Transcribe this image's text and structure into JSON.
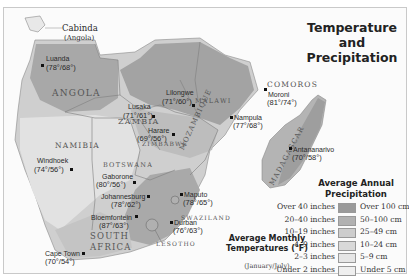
{
  "title": {
    "line1": "Temperature and",
    "line2": "Precipitation"
  },
  "countries": [
    {
      "name": "ANGOLA"
    },
    {
      "name": "ZAMBIA"
    },
    {
      "name": "MALAWI"
    },
    {
      "name": "ZIMBABWE"
    },
    {
      "name": "MOZAMBIQUE"
    },
    {
      "name": "NAMIBIA"
    },
    {
      "name": "BOTSWANA"
    },
    {
      "name": "SOUTH"
    },
    {
      "name": "AFRICA"
    },
    {
      "name": "SWAZILAND"
    },
    {
      "name": "LESOTHO"
    },
    {
      "name": "MADAGASCAR"
    },
    {
      "name": "COMOROS"
    }
  ],
  "region_labels": {
    "cabinda": "Cabinda",
    "cabinda_sub": "(Angola)"
  },
  "cities": [
    {
      "name": "Luanda",
      "temps": "(78°/68°)"
    },
    {
      "name": "Lilongwe",
      "temps": "(71°/60°)"
    },
    {
      "name": "Lusaka",
      "temps": "(71°/61°)"
    },
    {
      "name": "Harare",
      "temps": "(69°/56°)"
    },
    {
      "name": "Moroni",
      "temps": "(81°/74°)"
    },
    {
      "name": "Nampula",
      "temps": "(77°/68°)"
    },
    {
      "name": "Antananarivo",
      "temps": "(70°/58°)"
    },
    {
      "name": "Windhoek",
      "temps": "(74°/56°)"
    },
    {
      "name": "Gaborone",
      "temps": "(80°/56°)"
    },
    {
      "name": "Johannesburg",
      "temps": "(78°/62°)"
    },
    {
      "name": "Bloemfontein",
      "temps": "(87°/63°)"
    },
    {
      "name": "Maputo",
      "temps": "(78°/65°)"
    },
    {
      "name": "Durban",
      "temps": "(76°/63°)"
    },
    {
      "name": "Cape Town",
      "temps": "(70°/54°)"
    }
  ],
  "legend": {
    "title_line1": "Average Annual",
    "title_line2": "Precipitation",
    "items": [
      {
        "inches": "Over 40 inches",
        "cm": "Over 100 cm",
        "color": "#9a9a9a"
      },
      {
        "inches": "20–40 inches",
        "cm": "50–100 cm",
        "color": "#b1b1b1"
      },
      {
        "inches": "10–19 inches",
        "cm": "25–49 cm",
        "color": "#cdcdcd"
      },
      {
        "inches": "4–9 inches",
        "cm": "10–24 cm",
        "color": "#d9d9d9"
      },
      {
        "inches": "2–3 inches",
        "cm": "5–9 cm",
        "color": "#e6e6e6"
      },
      {
        "inches": "Under 2 inches",
        "cm": "Under 5 cm",
        "color": "#efefef"
      }
    ]
  },
  "temperature_note": {
    "line1": "Average Monthly",
    "line2": "Temperatures (°F)",
    "sub": "(January/July)"
  }
}
